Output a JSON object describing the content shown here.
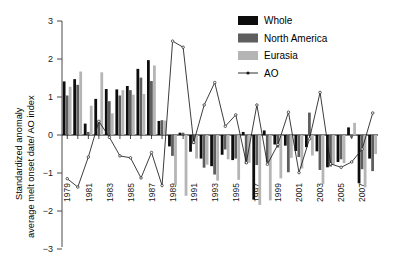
{
  "chart_data": {
    "type": "bar",
    "title": "",
    "xlabel": "",
    "ylabel": "Standardized anomaly average melt onset date/ AO index",
    "ylabel_line1": "Standardized anomaly",
    "ylabel_line2": "average melt onset date/ AO index",
    "ylim": [
      -3,
      3
    ],
    "yticks": [
      3,
      2,
      1,
      0,
      -1,
      -2,
      -3
    ],
    "ytick_labels": [
      "3",
      "2",
      "1",
      "0",
      "−1",
      "−2",
      "−3"
    ],
    "grid": false,
    "legend_position": "top-right",
    "categories": [
      1979,
      1980,
      1981,
      1982,
      1983,
      1984,
      1985,
      1986,
      1987,
      1988,
      1989,
      1990,
      1991,
      1992,
      1993,
      1994,
      1995,
      1996,
      1997,
      1998,
      1999,
      2000,
      2001,
      2002,
      2003,
      2004,
      2005,
      2006,
      2007,
      2008
    ],
    "xtick_labels": [
      "1979",
      "1981",
      "1983",
      "1985",
      "1987",
      "1989",
      "1991",
      "1993",
      "1995",
      "1997",
      "1999",
      "2001",
      "2003",
      "2005",
      "2007"
    ],
    "xticks": [
      1979,
      1981,
      1983,
      1985,
      1987,
      1989,
      1991,
      1993,
      1995,
      1997,
      1999,
      2001,
      2003,
      2005,
      2007
    ],
    "series": [
      {
        "name": "Whole",
        "color": "#0d0d0d",
        "values": [
          1.41,
          1.47,
          0.3,
          0.95,
          1.21,
          1.2,
          1.29,
          1.74,
          1.97,
          0.37,
          -0.3,
          0.06,
          -0.44,
          -0.62,
          -0.82,
          -0.52,
          -0.66,
          0.08,
          -1.7,
          0.12,
          -0.25,
          -0.28,
          -0.42,
          -0.32,
          -0.43,
          -0.85,
          -0.71,
          0.2,
          -1.27,
          -0.62
        ]
      },
      {
        "name": "North America",
        "color": "#5e5e5e",
        "values": [
          1.04,
          1.32,
          0.08,
          0.38,
          0.89,
          1.04,
          1.18,
          1.51,
          1.42,
          0.39,
          -0.55,
          0.06,
          -0.24,
          -0.86,
          -1.04,
          -0.38,
          -0.62,
          -0.76,
          -0.79,
          -0.72,
          -0.33,
          -0.98,
          -0.58,
          0.59,
          -0.92,
          -0.83,
          -0.64,
          -0.07,
          -0.9,
          -0.95
        ]
      },
      {
        "name": "Eurasia",
        "color": "#b5b5b5",
        "values": [
          1.27,
          1.67,
          0.77,
          1.65,
          0.57,
          1.18,
          1.06,
          1.08,
          1.83,
          0.38,
          -1.31,
          -1.6,
          -0.62,
          -0.78,
          -1.2,
          -0.64,
          -1.18,
          -0.73,
          -1.84,
          -1.72,
          -1.14,
          -0.6,
          -0.88,
          -0.54,
          -1.29,
          -0.78,
          -0.74,
          0.32,
          -1.38,
          -0.5
        ]
      }
    ],
    "line_series": {
      "name": "AO",
      "color": "#1a1a1a",
      "x": [
        1979,
        1980,
        1981,
        1982,
        1983,
        1984,
        1985,
        1986,
        1987,
        1988,
        1989,
        1990,
        1991,
        1992,
        1993,
        1994,
        1995,
        1996,
        1997,
        1998,
        1999,
        2000,
        2001,
        2002,
        2003,
        2004,
        2005,
        2006,
        2007,
        2008
      ],
      "values": [
        -1.15,
        -1.37,
        -0.58,
        0.36,
        -0.06,
        -0.55,
        -0.6,
        -1.13,
        -0.46,
        -1.33,
        2.47,
        2.31,
        -0.19,
        0.79,
        1.38,
        0.23,
        0.53,
        -0.73,
        0.79,
        -0.77,
        -0.25,
        0.6,
        -0.99,
        -0.1,
        1.12,
        -0.76,
        -0.85,
        -0.71,
        -0.37,
        0.58,
        0.75
      ]
    }
  },
  "legend": {
    "items": [
      {
        "label": "Whole",
        "swatch": "#0d0d0d",
        "type": "bar"
      },
      {
        "label": "North America",
        "swatch": "#5e5e5e",
        "type": "bar"
      },
      {
        "label": "Eurasia",
        "swatch": "#b5b5b5",
        "type": "bar"
      },
      {
        "label": "AO",
        "swatch": "#1a1a1a",
        "type": "line"
      }
    ]
  }
}
